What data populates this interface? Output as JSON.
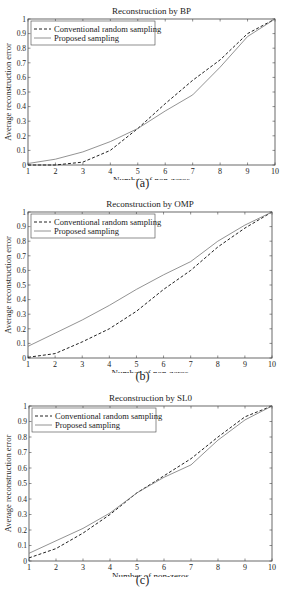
{
  "chart_data": [
    {
      "type": "line",
      "title": "Reconstruction by BP",
      "xlabel": "Number of non-zeros",
      "ylabel": "Average reconstruction error",
      "caption": "(a)",
      "xlim": [
        1,
        10
      ],
      "ylim": [
        0,
        1
      ],
      "x": [
        1,
        2,
        3,
        4,
        5,
        6,
        7,
        8,
        9,
        10
      ],
      "xticks": [
        "1",
        "2",
        "3",
        "4",
        "5",
        "6",
        "7",
        "8",
        "9",
        "10"
      ],
      "yticks": [
        "0",
        "0.1",
        "0.2",
        "0.3",
        "0.4",
        "0.5",
        "0.6",
        "0.7",
        "0.8",
        "0.9",
        "1"
      ],
      "legend_position": "upper left",
      "series": [
        {
          "name": "Conventional random sampling",
          "style": "dashed",
          "values": [
            0.0,
            0.0,
            0.02,
            0.1,
            0.25,
            0.42,
            0.58,
            0.72,
            0.9,
            1.0
          ]
        },
        {
          "name": "Proposed sampling",
          "style": "solid",
          "values": [
            0.01,
            0.04,
            0.09,
            0.16,
            0.25,
            0.37,
            0.48,
            0.67,
            0.88,
            1.0
          ]
        }
      ]
    },
    {
      "type": "line",
      "title": "Reconstruction by OMP",
      "xlabel": "Number of non-zeros",
      "ylabel": "Average reconstruction error",
      "caption": "(b)",
      "xlim": [
        1,
        10
      ],
      "ylim": [
        0,
        1
      ],
      "x": [
        1,
        2,
        3,
        4,
        5,
        6,
        7,
        8,
        9,
        10
      ],
      "xticks": [
        "1",
        "2",
        "3",
        "4",
        "5",
        "6",
        "7",
        "8",
        "9",
        "10"
      ],
      "yticks": [
        "0",
        "0.1",
        "0.2",
        "0.3",
        "0.4",
        "0.5",
        "0.6",
        "0.7",
        "0.8",
        "0.9",
        "1"
      ],
      "legend_position": "upper left",
      "series": [
        {
          "name": "Conventional random sampling",
          "style": "dashed",
          "values": [
            0.005,
            0.03,
            0.11,
            0.2,
            0.32,
            0.47,
            0.6,
            0.76,
            0.89,
            1.0
          ]
        },
        {
          "name": "Proposed sampling",
          "style": "solid",
          "values": [
            0.08,
            0.17,
            0.26,
            0.36,
            0.47,
            0.57,
            0.66,
            0.8,
            0.91,
            1.0
          ]
        }
      ]
    },
    {
      "type": "line",
      "title": "Reconstruction by SL0",
      "xlabel": "Number of non-zeros",
      "ylabel": "Average reconstruction error",
      "caption": "(c)",
      "xlim": [
        1,
        10
      ],
      "ylim": [
        0,
        1
      ],
      "x": [
        1,
        2,
        3,
        4,
        5,
        6,
        7,
        8,
        9,
        10
      ],
      "xticks": [
        "1",
        "2",
        "3",
        "4",
        "5",
        "6",
        "7",
        "8",
        "9",
        "10"
      ],
      "yticks": [
        "0",
        "0.1",
        "0.2",
        "0.3",
        "0.4",
        "0.5",
        "0.6",
        "0.7",
        "0.8",
        "0.9",
        "1"
      ],
      "legend_position": "upper left",
      "series": [
        {
          "name": "Conventional random sampling",
          "style": "dashed",
          "values": [
            0.02,
            0.08,
            0.18,
            0.3,
            0.44,
            0.55,
            0.66,
            0.8,
            0.93,
            1.0
          ]
        },
        {
          "name": "Proposed sampling",
          "style": "solid",
          "values": [
            0.05,
            0.13,
            0.21,
            0.31,
            0.44,
            0.54,
            0.62,
            0.78,
            0.91,
            1.0
          ]
        }
      ]
    }
  ]
}
